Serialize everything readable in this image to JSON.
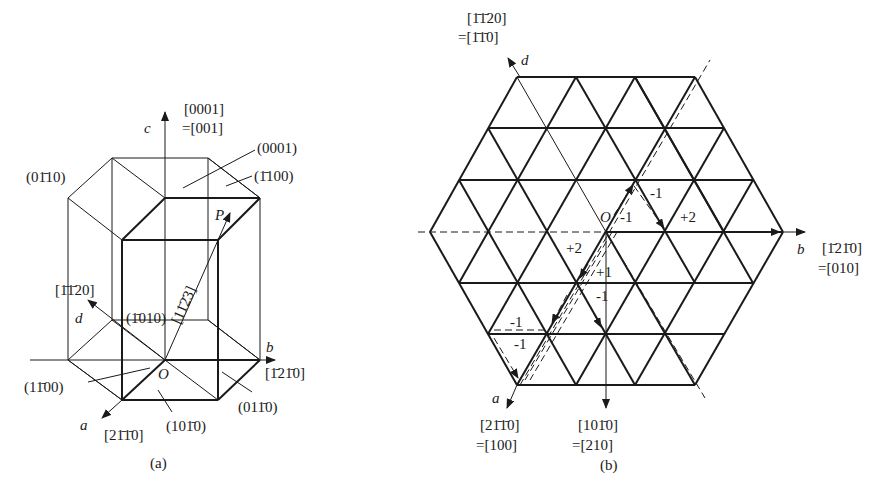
{
  "figure_a": {
    "caption": "(a)",
    "axes": {
      "a": "a",
      "b": "b",
      "c": "c",
      "d": "d"
    },
    "origin": "O",
    "point_p": "P",
    "directions": {
      "c_index4": "[0001]",
      "c_index3": "=[001]",
      "d_index4": "[1̄1̄20]",
      "a_index4": "[21̄1̄0]",
      "b_index4": "[1̄21̄0]",
      "op_index4": "[11̄2̄3]"
    },
    "planes": {
      "top": "(0001)",
      "back_right": "(1̄100)",
      "back_left": "(01̄10)",
      "back": "(1̄010)",
      "front_left": "(11̄00)",
      "front": "(101̄0)",
      "front_right": "(011̄0)"
    }
  },
  "figure_b": {
    "caption": "(b)",
    "axes": {
      "a": "a",
      "b": "b",
      "d": "d"
    },
    "origin": "O",
    "directions": {
      "d_index4": "[1̄1̄20]",
      "d_index3": "=[1̄1̄0]",
      "b_index4": "[1̄21̄0]",
      "b_index3": "=[010]",
      "a_index4": "[21̄1̄0]",
      "a_index3": "=[100]",
      "down_index4": "[101̄0]",
      "down_index3": "=[210]"
    },
    "steps": [
      "-1",
      "-1",
      "+2",
      "+2",
      "+1",
      "-1",
      "-1",
      "-1"
    ]
  }
}
